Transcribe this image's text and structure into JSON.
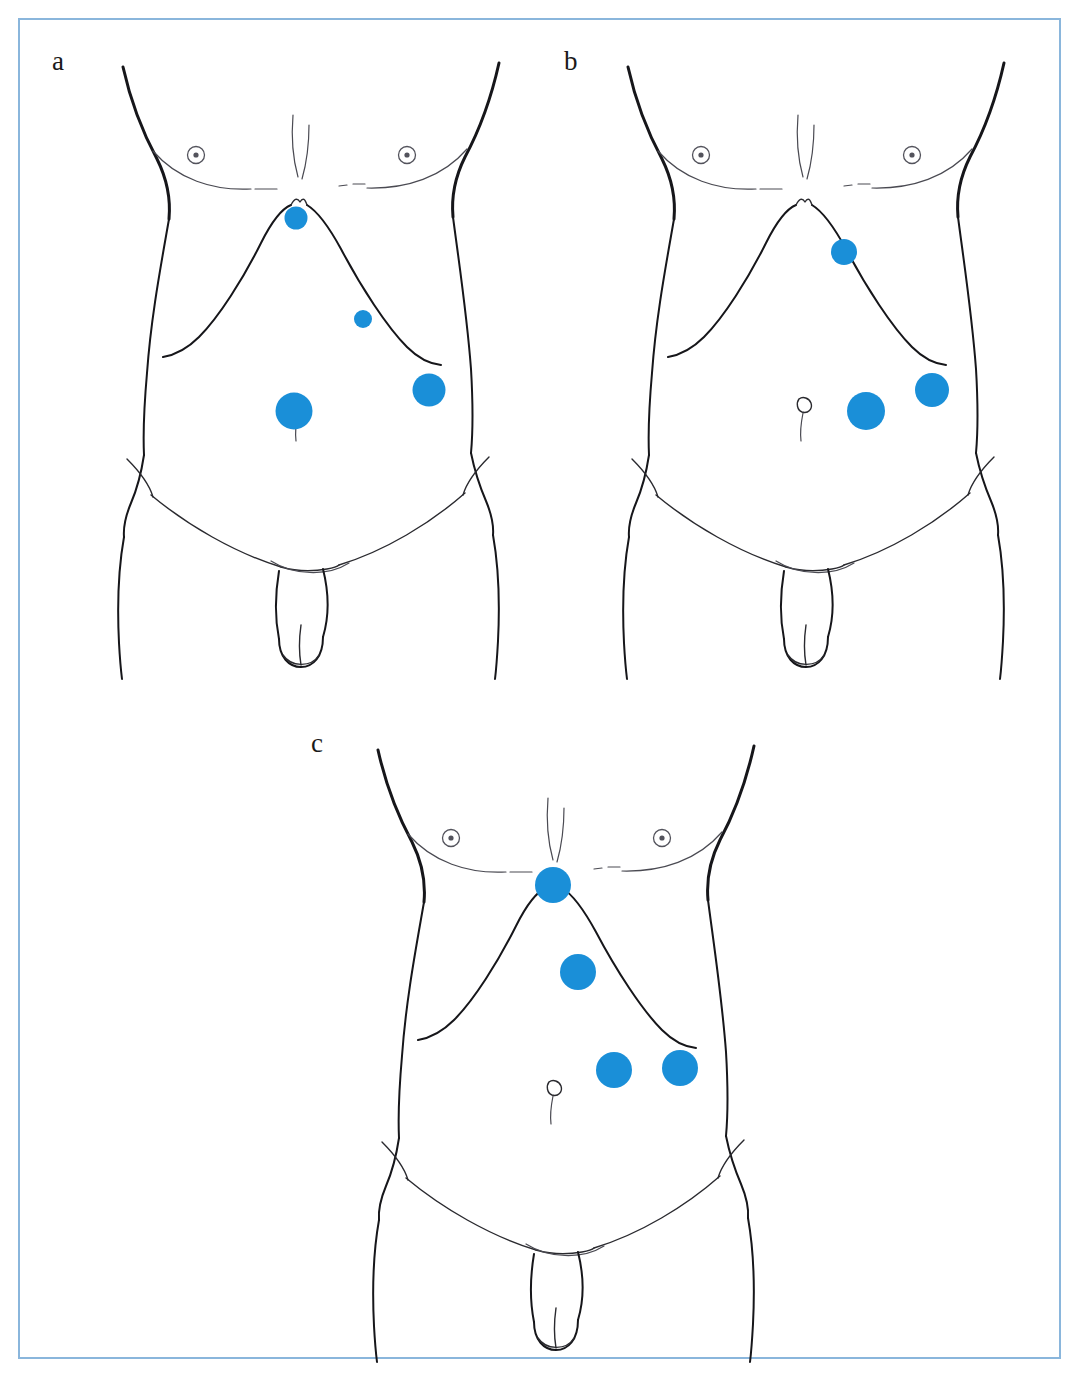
{
  "figure": {
    "type": "medical-illustration",
    "frame_color": "#8ab6dc",
    "marker_color": "#1a8fd8",
    "line_color": "#16161a",
    "background_color": "#ffffff",
    "panel_count": 3
  },
  "panels": [
    {
      "id": "a",
      "label": "a",
      "label_x": 52,
      "label_y": 48,
      "origin_x": 95,
      "origin_y": 55,
      "width": 430,
      "height": 625,
      "port_count": 4,
      "ports": [
        {
          "name": "subxiphoid-port",
          "cx": 201,
          "cy": 163,
          "r": 11.5
        },
        {
          "name": "epigastric-port",
          "cx": 268,
          "cy": 264,
          "r": 9.0
        },
        {
          "name": "periumbilical-port",
          "cx": 199,
          "cy": 356,
          "r": 18.5
        },
        {
          "name": "left-flank-port",
          "cx": 334,
          "cy": 335,
          "r": 16.5
        }
      ]
    },
    {
      "id": "b",
      "label": "b",
      "label_x": 564,
      "label_y": 48,
      "origin_x": 600,
      "origin_y": 55,
      "width": 430,
      "height": 625,
      "port_count": 3,
      "ports": [
        {
          "name": "upper-epigastric-port",
          "cx": 244,
          "cy": 197,
          "r": 13.0
        },
        {
          "name": "pararectal-port",
          "cx": 266,
          "cy": 356,
          "r": 19.0
        },
        {
          "name": "left-flank-port",
          "cx": 332,
          "cy": 335,
          "r": 17.0
        }
      ]
    },
    {
      "id": "c",
      "label": "c",
      "label_x": 311,
      "label_y": 730,
      "origin_x": 350,
      "origin_y": 738,
      "width": 430,
      "height": 625,
      "port_count": 4,
      "ports": [
        {
          "name": "subxiphoid-port",
          "cx": 203,
          "cy": 147,
          "r": 18.0
        },
        {
          "name": "epigastric-port",
          "cx": 228,
          "cy": 234,
          "r": 18.0
        },
        {
          "name": "right-pararectal-port",
          "cx": 264,
          "cy": 332,
          "r": 18.0
        },
        {
          "name": "left-flank-port",
          "cx": 330,
          "cy": 330,
          "r": 18.0
        }
      ]
    }
  ],
  "anatomy_landmarks": {
    "nipple_left": {
      "cx": 101,
      "cy": 100,
      "r_outer": 8.5,
      "r_inner": 2.6
    },
    "nipple_right": {
      "cx": 312,
      "cy": 100,
      "r_outer": 8.5,
      "r_inner": 2.6
    },
    "umbilicus": {
      "cx": 205,
      "cy": 348
    },
    "labels": [
      "shoulder-outline",
      "chest-contour",
      "nipple",
      "sternal-notch",
      "costal-margin",
      "umbilicus",
      "iliac-crest",
      "inguinal-crease",
      "genitalia"
    ]
  }
}
